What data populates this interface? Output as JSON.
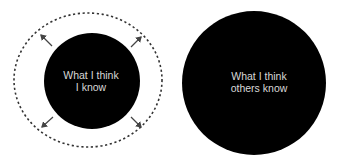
{
  "diagram": {
    "left_group": {
      "circle_label_line1": "What I think",
      "circle_label_line2": "I know",
      "boundary_style": "dashed",
      "expansion_arrows": 4
    },
    "right_group": {
      "circle_label_line1": "What I think",
      "circle_label_line2": "others know"
    },
    "colors": {
      "circle_fill": "#000000",
      "label_text": "#d8d8d8",
      "dashed_outline": "#333333",
      "arrow": "#444444",
      "background": "#ffffff"
    }
  }
}
